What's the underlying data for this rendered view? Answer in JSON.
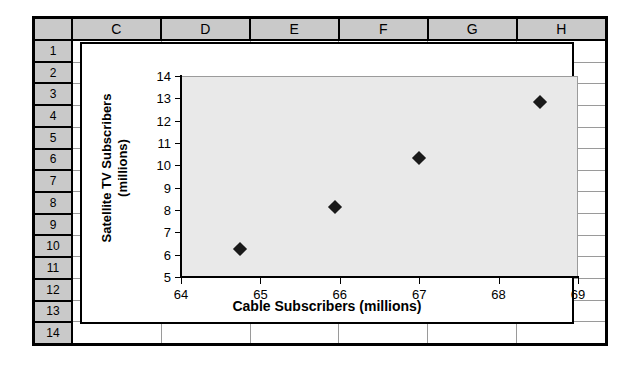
{
  "spreadsheet": {
    "columns": [
      "C",
      "D",
      "E",
      "F",
      "G",
      "H"
    ],
    "rows": [
      "1",
      "2",
      "3",
      "4",
      "5",
      "6",
      "7",
      "8",
      "9",
      "10",
      "11",
      "12",
      "13",
      "14"
    ],
    "corner_label": ""
  },
  "chart_data": {
    "type": "scatter",
    "title": "",
    "xlabel": "Cable Subscribers (millions)",
    "ylabel": "Satellite TV Subscribers\n(millions)",
    "ylabel_line1": "Satellite TV Subscribers",
    "ylabel_line2": "(millions)",
    "xlim": [
      64,
      69
    ],
    "ylim": [
      5,
      14
    ],
    "xticks": [
      64,
      65,
      66,
      67,
      68,
      69
    ],
    "yticks": [
      5,
      6,
      7,
      8,
      9,
      10,
      11,
      12,
      13,
      14
    ],
    "xtick_labels": [
      "64",
      "65",
      "66",
      "67",
      "68",
      "69"
    ],
    "ytick_labels": [
      "5",
      "6",
      "7",
      "8",
      "9",
      "10",
      "11",
      "12",
      "13",
      "14"
    ],
    "grid": false,
    "legend": null,
    "marker": "diamond",
    "marker_color": "#1a1a1a",
    "plot_background": "#e9e9e9",
    "points": [
      {
        "x": 64.74,
        "y": 6.25
      },
      {
        "x": 65.94,
        "y": 8.15
      },
      {
        "x": 67.0,
        "y": 10.35
      },
      {
        "x": 68.52,
        "y": 12.85
      }
    ],
    "series": [
      {
        "name": "Satellite TV vs Cable Subscribers",
        "x": [
          64.74,
          65.94,
          67.0,
          68.52
        ],
        "values": [
          6.25,
          8.15,
          10.35,
          12.85
        ]
      }
    ]
  }
}
